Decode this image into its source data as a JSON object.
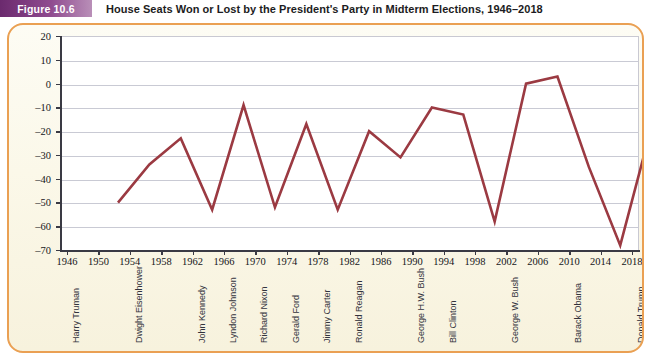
{
  "figure": {
    "tag": "Figure 10.6",
    "title": "House Seats Won or Lost by the President's Party in Midterm Elections, 1946–2018"
  },
  "colors": {
    "card_border": "#eaa053",
    "card_background": "#fbf8e9",
    "line": "#9b3a42",
    "gridline": "#c9cad4",
    "axis": "#3a3a44",
    "tag_purple": "#6b2a6e"
  },
  "chart_data": {
    "type": "line",
    "title": "House Seats Won or Lost by the President's Party in Midterm Elections, 1946–2018",
    "xlabel": "",
    "ylabel": "House seat change",
    "ylim": [
      -70,
      20
    ],
    "ytick_step": 10,
    "yticks": [
      20,
      10,
      0,
      -10,
      -20,
      -30,
      -40,
      -50,
      -60,
      -70
    ],
    "ytick_labels": [
      "20",
      "10",
      "0",
      "–10",
      "–20",
      "–30",
      "–40",
      "–50",
      "–60",
      "–70"
    ],
    "grid": true,
    "legend": "none",
    "categories": [
      1946,
      1950,
      1954,
      1958,
      1962,
      1966,
      1970,
      1974,
      1978,
      1982,
      1986,
      1990,
      1994,
      1998,
      2002,
      2006,
      2010,
      2014,
      2018
    ],
    "xtick_labels": [
      "1946",
      "1950",
      "1954",
      "1958",
      "1962",
      "1966",
      "1970",
      "1974",
      "1978",
      "1982",
      "1986",
      "1990",
      "1994",
      "1998",
      "2002",
      "2006",
      "2010",
      "2014",
      "2018"
    ],
    "values": [
      -45,
      -29,
      -18,
      -48,
      -4,
      -47,
      -12,
      -48,
      -15,
      -26,
      -5,
      -8,
      -53,
      5,
      8,
      -30,
      -63,
      -13,
      -40
    ],
    "series": [
      {
        "name": "House seat change",
        "values": [
          -45,
          -29,
          -18,
          -48,
          -4,
          -47,
          -12,
          -48,
          -15,
          -26,
          -5,
          -8,
          -53,
          5,
          8,
          -30,
          -63,
          -13,
          -40
        ]
      }
    ],
    "presidents": [
      {
        "name": "Harry Truman",
        "at_year": 1946
      },
      {
        "name": "Dwight Eisenhower",
        "at_year": 1954
      },
      {
        "name": "John Kennedy",
        "at_year": 1962
      },
      {
        "name": "Lyndon Johnson",
        "at_year": 1966
      },
      {
        "name": "Richard Nixon",
        "at_year": 1970
      },
      {
        "name": "Gerald Ford",
        "at_year": 1974
      },
      {
        "name": "Jimmy Carter",
        "at_year": 1978
      },
      {
        "name": "Ronald Reagan",
        "at_year": 1982
      },
      {
        "name": "George H.W. Bush",
        "at_year": 1990
      },
      {
        "name": "Bill Clinton",
        "at_year": 1994
      },
      {
        "name": "George W. Bush",
        "at_year": 2002
      },
      {
        "name": "Barack Obama",
        "at_year": 2010
      },
      {
        "name": "Donald Trump",
        "at_year": 2018
      }
    ]
  }
}
